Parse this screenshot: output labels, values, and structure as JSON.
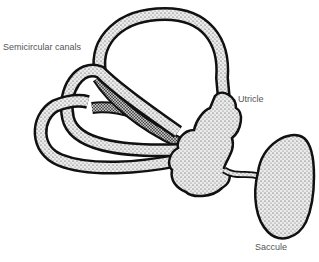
{
  "diagram": {
    "labels": {
      "semicircular_canals": "Semicircular canals",
      "utricle": "Utricle",
      "saccule": "Saccule"
    },
    "colors": {
      "outline": "#111111",
      "fill": "#d9d9d9",
      "label_text": "#555555",
      "background": "#ffffff"
    }
  }
}
